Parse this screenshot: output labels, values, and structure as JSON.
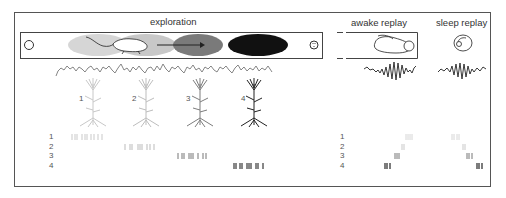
{
  "sections": {
    "exploration": "exploration",
    "awake_replay": "awake replay",
    "sleep_replay": "sleep replay"
  },
  "place_fields": [
    {
      "id": "1",
      "color": "#d6d6d6"
    },
    {
      "id": "2",
      "color": "#c2c2c2"
    },
    {
      "id": "3",
      "color": "#7a7a7a"
    },
    {
      "id": "4",
      "color": "#111111"
    }
  ],
  "neurons": [
    {
      "label": "1",
      "color": "#c8c8c8"
    },
    {
      "label": "2",
      "color": "#bdbdbd"
    },
    {
      "label": "3",
      "color": "#7d7d7d"
    },
    {
      "label": "4",
      "color": "#222222"
    }
  ],
  "raster_rows": {
    "exploration": [
      "1",
      "2",
      "3",
      "4"
    ],
    "replay": [
      "1",
      "2",
      "3",
      "4"
    ]
  },
  "colors": {
    "frame": "#555555",
    "trace": "#777777",
    "ripple": "#222222"
  }
}
